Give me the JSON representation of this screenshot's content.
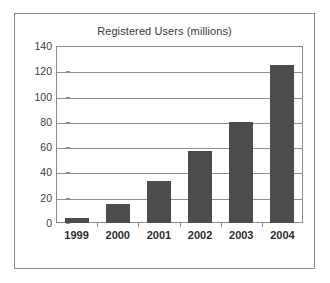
{
  "chart_data": {
    "type": "bar",
    "title": "Registered Users (millions)",
    "xlabel": "",
    "ylabel": "",
    "categories": [
      "1999",
      "2000",
      "2001",
      "2002",
      "2003",
      "2004"
    ],
    "values": [
      4,
      15,
      33,
      57,
      80,
      125
    ],
    "ylim": [
      0,
      140
    ],
    "yticks": [
      0,
      20,
      40,
      60,
      80,
      100,
      120,
      140
    ],
    "ytick_labels": [
      "0",
      "20",
      "40",
      "60",
      "80",
      "100",
      "120",
      "140"
    ],
    "grid": true,
    "legend": null,
    "series": [
      {
        "name": "Registered Users",
        "values": [
          4,
          15,
          33,
          57,
          80,
          125
        ],
        "color": "#4c4c4c"
      }
    ],
    "colors": {
      "bar": "#4c4c4c",
      "axis": "#8d8d8d",
      "text": "#2e2e2e",
      "title": "#3b3b3b",
      "background": "#ffffff"
    }
  }
}
